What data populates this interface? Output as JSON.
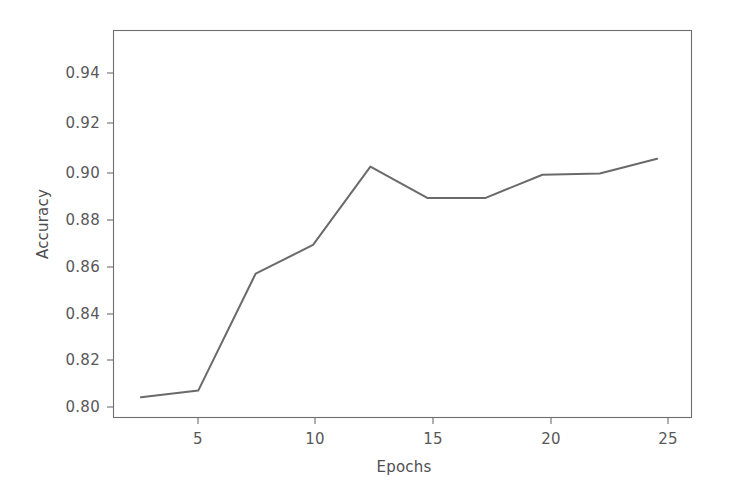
{
  "figure": {
    "background_color": "#ffffff",
    "axes_color": "#6e6e70",
    "line_color": "#6a6a6c",
    "text_color": "#58585a"
  },
  "axis": {
    "xlabel": "Epochs",
    "ylabel": "Accuracy",
    "xticks": [
      "5",
      "10",
      "15",
      "20",
      "25"
    ],
    "yticks": [
      "0.94",
      "0.92",
      "0.90",
      "0.88",
      "0.86",
      "0.84",
      "0.82",
      "0.80"
    ]
  },
  "chart_data": {
    "type": "line",
    "title": "",
    "subtitle": "",
    "xlabel": "Epochs",
    "ylabel": "Accuracy",
    "xlim": [
      1.3,
      26.5
    ],
    "ylim": [
      0.795,
      0.952
    ],
    "xticks": [
      5,
      10,
      15,
      20,
      25
    ],
    "yticks": [
      0.8,
      0.82,
      0.84,
      0.86,
      0.88,
      0.9,
      0.92,
      0.94
    ],
    "grid": false,
    "legend": null,
    "annotations": [],
    "series": [
      {
        "name": "Accuracy",
        "color": "#6a6a6c",
        "x": [
          2.5,
          5.0,
          7.5,
          10.0,
          12.5,
          15.0,
          17.5,
          20.0,
          22.5,
          25.0
        ],
        "values": [
          0.8032,
          0.806,
          0.8534,
          0.865,
          0.8968,
          0.884,
          0.884,
          0.8935,
          0.894,
          0.9
        ]
      }
    ]
  }
}
